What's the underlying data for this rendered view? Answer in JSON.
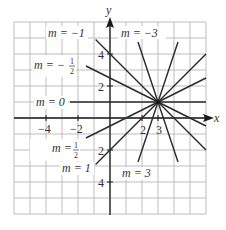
{
  "figure": {
    "axes": {
      "x_label": "x",
      "y_label": "y",
      "x_ticks": [
        {
          "value": -4,
          "label": "−4"
        },
        {
          "value": -2,
          "label": "−2"
        },
        {
          "value": 2,
          "label": "2"
        },
        {
          "value": 3,
          "label": "3"
        }
      ],
      "y_ticks": [
        {
          "value": 4,
          "label": "4"
        },
        {
          "value": 2,
          "label": "2"
        },
        {
          "value": -2,
          "label": "2"
        },
        {
          "value": -4,
          "label": "4"
        }
      ]
    },
    "point": {
      "x": 3,
      "y": 1
    },
    "line_labels": {
      "m_neg1": "m = −1",
      "m_neg3": "m = −3",
      "m_neg_half_prefix": "m = −",
      "m_0": "m = 0",
      "m_half_prefix": "m =",
      "m_1": "m = 1",
      "m_3": "m = 3",
      "frac_num": "1",
      "frac_den": "2"
    },
    "colors": {
      "grid": "#bdbdbd",
      "axis": "#1a1a1a",
      "line": "#2a2a2a",
      "text": "#333333"
    }
  },
  "chart_data": {
    "type": "line",
    "xlabel": "x",
    "ylabel": "y",
    "xlim": [
      -6,
      6
    ],
    "ylim": [
      -6,
      6
    ],
    "grid": true,
    "series": [
      {
        "name": "m = -3",
        "slope": -3,
        "points": [
          [
            1.75,
            4.75
          ],
          [
            4.25,
            -2.75
          ]
        ]
      },
      {
        "name": "m = -1",
        "slope": -1,
        "points": [
          [
            -0.9,
            4.9
          ],
          [
            6,
            -2
          ]
        ]
      },
      {
        "name": "m = -1/2",
        "slope": -0.5,
        "points": [
          [
            -1.5,
            3.25
          ],
          [
            6,
            -0.5
          ]
        ]
      },
      {
        "name": "m = 0",
        "slope": 0,
        "points": [
          [
            -2.5,
            1
          ],
          [
            6,
            1
          ]
        ]
      },
      {
        "name": "m = 1/2",
        "slope": 0.5,
        "points": [
          [
            -1.5,
            -1.25
          ],
          [
            6,
            2.5
          ]
        ]
      },
      {
        "name": "m = 1",
        "slope": 1,
        "points": [
          [
            -0.9,
            -2.9
          ],
          [
            6,
            4
          ]
        ]
      },
      {
        "name": "m = 3",
        "slope": 3,
        "points": [
          [
            1.75,
            -2.75
          ],
          [
            4.25,
            4.75
          ]
        ]
      }
    ]
  }
}
